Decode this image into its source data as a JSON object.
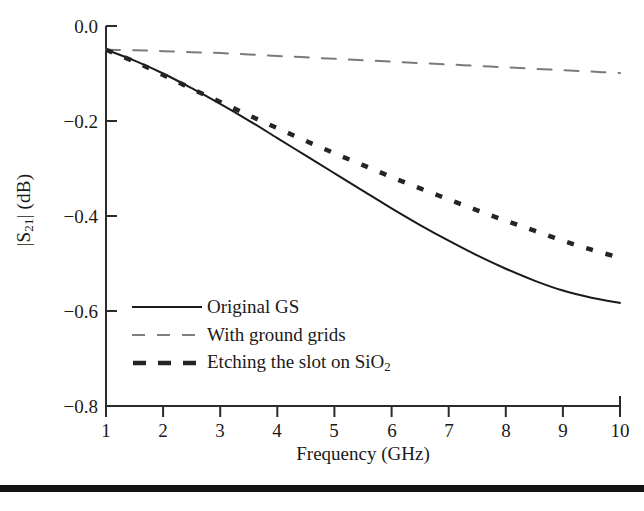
{
  "chart_data": {
    "type": "line",
    "title": "",
    "xlabel": "Frequency (GHz)",
    "ylabel": "|S21| (dB)",
    "ylabel_base": "|S",
    "ylabel_sub": "21",
    "ylabel_tail": "| (dB)",
    "xlim": [
      1,
      10
    ],
    "ylim": [
      -0.8,
      0.0
    ],
    "grid": false,
    "legend_position": "lower-left-inside",
    "xticks": [
      1,
      2,
      3,
      4,
      5,
      6,
      7,
      8,
      9,
      10
    ],
    "xtick_labels": [
      "1",
      "2",
      "3",
      "4",
      "5",
      "6",
      "7",
      "8",
      "9",
      "10"
    ],
    "yticks": [
      0.0,
      -0.2,
      -0.4,
      -0.6,
      -0.8
    ],
    "ytick_labels": [
      "0.0",
      "−0.2",
      "−0.4",
      "−0.6",
      "−0.8"
    ],
    "x": [
      1,
      1.5,
      2,
      2.5,
      3,
      3.5,
      4,
      4.5,
      5,
      5.5,
      6,
      6.5,
      7,
      7.5,
      8,
      8.5,
      9,
      9.5,
      10
    ],
    "series": [
      {
        "name": "Original GS",
        "style": "solid",
        "color": "#1a1a1a",
        "width": 2.0,
        "values": [
          -0.05,
          -0.073,
          -0.1,
          -0.131,
          -0.164,
          -0.199,
          -0.236,
          -0.273,
          -0.31,
          -0.347,
          -0.384,
          -0.419,
          -0.452,
          -0.483,
          -0.511,
          -0.536,
          -0.557,
          -0.572,
          -0.583
        ]
      },
      {
        "name": "With ground grids",
        "style": "dashed-thin",
        "color": "#7a7a7a",
        "width": 2.0,
        "values": [
          -0.05,
          -0.051,
          -0.053,
          -0.055,
          -0.057,
          -0.06,
          -0.063,
          -0.066,
          -0.069,
          -0.072,
          -0.075,
          -0.078,
          -0.081,
          -0.084,
          -0.087,
          -0.09,
          -0.093,
          -0.096,
          -0.099
        ]
      },
      {
        "name": "Etching the slot on SiO2",
        "label_base": "Etching the slot on SiO",
        "label_sub": "2",
        "style": "dashed-thick",
        "color": "#242424",
        "width": 4.5,
        "values": [
          -0.05,
          -0.075,
          -0.103,
          -0.132,
          -0.16,
          -0.188,
          -0.215,
          -0.242,
          -0.268,
          -0.293,
          -0.318,
          -0.342,
          -0.365,
          -0.388,
          -0.41,
          -0.431,
          -0.452,
          -0.471,
          -0.488
        ]
      }
    ]
  },
  "legend": {
    "items": [
      {
        "label": "Original GS",
        "icon": "solid-line-icon"
      },
      {
        "label": "With ground grids",
        "icon": "dashed-line-icon"
      },
      {
        "label": "Etching the slot on SiO2",
        "icon": "thick-dashed-line-icon"
      }
    ]
  },
  "axes": {
    "x_title": "Frequency (GHz)",
    "x_tick_labels": [
      "1",
      "2",
      "3",
      "4",
      "5",
      "6",
      "7",
      "8",
      "9",
      "10"
    ],
    "y_tick_labels": [
      "0.0",
      "−0.2",
      "−0.4",
      "−0.6",
      "−0.8"
    ]
  }
}
